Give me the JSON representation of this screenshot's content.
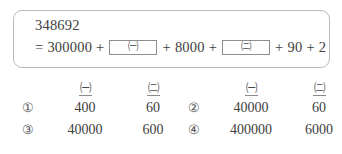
{
  "problem": {
    "number": "348692",
    "equation": {
      "equals_sign": "=",
      "term1": "300000",
      "plus1": "+",
      "blank1_symbol": "㈠",
      "plus2": "+",
      "term2": "8000",
      "plus3": "+",
      "blank2_symbol": "㈡",
      "plus4": "+",
      "term3": "90",
      "plus5": "+",
      "term4": "2"
    }
  },
  "options": {
    "headers": {
      "col_a": "㈠",
      "col_b": "㈡"
    },
    "groups": [
      {
        "name": "left",
        "rows": [
          {
            "marker": "①",
            "a": "400",
            "b": "60"
          },
          {
            "marker": "③",
            "a": "40000",
            "b": "600"
          }
        ]
      },
      {
        "name": "right",
        "rows": [
          {
            "marker": "②",
            "a": "40000",
            "b": "60"
          },
          {
            "marker": "④",
            "a": "400000",
            "b": "6000"
          }
        ]
      }
    ]
  },
  "colors": {
    "text": "#404040",
    "border": "#b9b9b9",
    "blank_border": "#8d8d8d",
    "background": "#ffffff"
  }
}
